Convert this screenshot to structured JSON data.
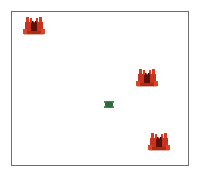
{
  "game": {
    "arena": {
      "left": 11,
      "top": 11,
      "width": 178,
      "height": 155,
      "border_color": "#6e6e6e",
      "background": "#ffffff"
    },
    "crabs": [
      {
        "id": "crab-1",
        "x": 23,
        "y": 17
      },
      {
        "id": "crab-2",
        "x": 136,
        "y": 69
      },
      {
        "id": "crab-3",
        "x": 148,
        "y": 133
      }
    ],
    "player": {
      "type": "turtle",
      "x": 104,
      "y": 100,
      "color": "#3f7f4a"
    },
    "colors": {
      "crab_body": "#c8321e",
      "crab_dark": "#5a1208",
      "crab_claw": "#e0431f"
    }
  }
}
